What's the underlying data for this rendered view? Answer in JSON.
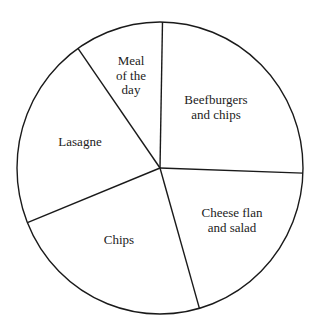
{
  "chart_data": {
    "type": "pie",
    "title": "",
    "unit": "degrees",
    "start_angle_deg": 1,
    "direction": "clockwise",
    "legend": "none (labels inside slices)",
    "slices": [
      {
        "label": "Beefburgers and chips",
        "lines": [
          "Beefburgers",
          "and chips"
        ],
        "value": 91,
        "label_pos": [
          216,
          107
        ]
      },
      {
        "label": "Cheese flan and salad",
        "lines": [
          "Cheese flan",
          "and salad"
        ],
        "value": 72,
        "label_pos": [
          232,
          220
        ]
      },
      {
        "label": "Chips",
        "lines": [
          "Chips"
        ],
        "value": 84,
        "label_pos": [
          119,
          239
        ]
      },
      {
        "label": "Lasagne",
        "lines": [
          "Lasagne"
        ],
        "value": 77,
        "label_pos": [
          80,
          141
        ]
      },
      {
        "label": "Meal of the day",
        "lines": [
          "Meal",
          "of the",
          "day"
        ],
        "value": 36,
        "label_pos": [
          131,
          75
        ]
      }
    ],
    "categories": [
      "Beefburgers and chips",
      "Cheese flan and salad",
      "Chips",
      "Lasagne",
      "Meal of the day"
    ],
    "values": [
      91,
      72,
      84,
      77,
      36
    ]
  },
  "geometry": {
    "cx": 160,
    "cy": 168,
    "rx": 143,
    "ry": 146,
    "line_color": "#1a1a1a",
    "fill_color": "#ffffff",
    "line_height": 14.5
  }
}
